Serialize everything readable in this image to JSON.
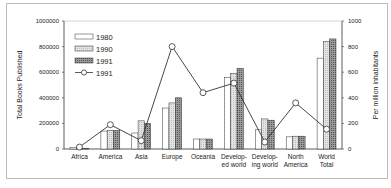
{
  "chart_data": {
    "type": "bar",
    "title": "",
    "xlabel": "",
    "ylabel": "Total Books Published",
    "y2label": "Per million inhabitants",
    "ylim": [
      0,
      1000000
    ],
    "y2lim": [
      0,
      1000
    ],
    "yticks": [
      "0",
      "200000",
      "400000",
      "600000",
      "800000",
      "1000000"
    ],
    "y2ticks": [
      "0",
      "200",
      "400",
      "600",
      "800",
      "1000"
    ],
    "grid": false,
    "legend_position": "upper-left",
    "categories": [
      [
        "Africa"
      ],
      [
        "America"
      ],
      [
        "Asia"
      ],
      [
        "Europe"
      ],
      [
        "Oceania"
      ],
      [
        "Develop-",
        "ed world"
      ],
      [
        "Develop-",
        "ing world"
      ],
      [
        "North",
        "America"
      ],
      [
        "World",
        "Total"
      ]
    ],
    "series": [
      {
        "name": "1980",
        "type": "bar",
        "axis": "left",
        "style": "white",
        "values": [
          12000,
          140000,
          125000,
          320000,
          78000,
          560000,
          150000,
          95000,
          710000
        ]
      },
      {
        "name": "1990",
        "type": "bar",
        "axis": "left",
        "style": "light-hatch",
        "values": [
          5000,
          145000,
          220000,
          360000,
          78000,
          590000,
          235000,
          100000,
          840000
        ]
      },
      {
        "name": "1991",
        "type": "bar",
        "axis": "left",
        "style": "dark-hatch",
        "values": [
          5000,
          145000,
          200000,
          400000,
          78000,
          630000,
          225000,
          100000,
          860000
        ]
      },
      {
        "name": "1991",
        "type": "line",
        "axis": "right",
        "marker": "open-circle",
        "values": [
          15,
          190,
          65,
          800,
          440,
          515,
          55,
          360,
          155
        ]
      }
    ]
  }
}
